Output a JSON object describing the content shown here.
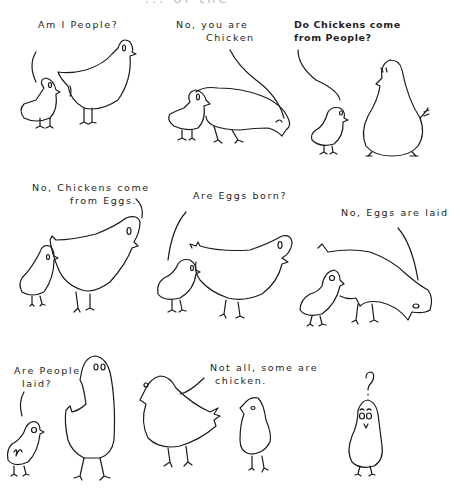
{
  "title_partial": "... of the",
  "panels": [
    {
      "id": 1,
      "caption": "Am I People?"
    },
    {
      "id": 2,
      "caption_line1": "No, you are",
      "caption_line2": "Chicken"
    },
    {
      "id": 3,
      "caption_line1": "Do Chickens come",
      "caption_line2": "from People?"
    },
    {
      "id": 4,
      "caption_line1": "No, Chickens come",
      "caption_line2": "from Eggs."
    },
    {
      "id": 5,
      "caption": "Are Eggs born?"
    },
    {
      "id": 6,
      "caption": "No, Eggs are laid"
    },
    {
      "id": 7,
      "caption_line1": "Are People",
      "caption_line2": "laid?"
    },
    {
      "id": 8,
      "caption_line1": "Not all, some are",
      "caption_line2": "chicken."
    },
    {
      "id": 9,
      "caption": "?"
    }
  ],
  "colors": {
    "ink": "#1a1a1a",
    "background": "#ffffff"
  }
}
